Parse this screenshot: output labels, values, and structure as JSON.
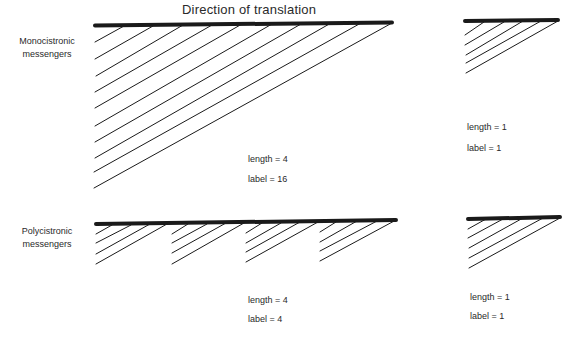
{
  "title": "Direction of translation",
  "rows": [
    {
      "label_line1": "Monocistronic",
      "label_line2": "messengers",
      "panels": [
        {
          "length_text": "length = 4",
          "label_text": "label = 16",
          "length": 4,
          "label": 16,
          "cistrons": 1,
          "lines": 10
        },
        {
          "length_text": "length = 1",
          "label_text": "label = 1",
          "length": 1,
          "label": 1,
          "cistrons": 1,
          "lines": 5
        }
      ]
    },
    {
      "label_line1": "Polycistronic",
      "label_line2": "messengers",
      "panels": [
        {
          "length_text": "length = 4",
          "label_text": "label = 4",
          "length": 4,
          "label": 4,
          "cistrons": 4,
          "lines_per_cistron": 4
        },
        {
          "length_text": "length = 1",
          "label_text": "label = 1",
          "length": 1,
          "label": 1,
          "cistrons": 1,
          "lines": 5
        }
      ]
    }
  ],
  "colors": {
    "line": "#1a1a1a",
    "text": "#2a2a2a",
    "background": "#ffffff"
  }
}
